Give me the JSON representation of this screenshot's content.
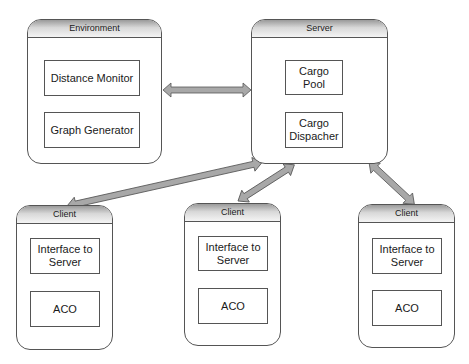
{
  "diagram": {
    "nodes": [
      {
        "id": "environment",
        "title": "Environment",
        "components": [
          "Distance Monitor",
          "Graph Generator"
        ]
      },
      {
        "id": "server",
        "title": "Server",
        "components": [
          "Cargo Pool",
          "Cargo Dispacher"
        ]
      },
      {
        "id": "client1",
        "title": "Client",
        "components": [
          "Interface to Server",
          "ACO"
        ]
      },
      {
        "id": "client2",
        "title": "Client",
        "components": [
          "Interface to Server",
          "ACO"
        ]
      },
      {
        "id": "client3",
        "title": "Client",
        "components": [
          "Interface to Server",
          "ACO"
        ]
      }
    ],
    "edges": [
      {
        "from": "environment",
        "to": "server",
        "type": "bidirectional"
      },
      {
        "from": "server",
        "to": "client1",
        "type": "bidirectional"
      },
      {
        "from": "server",
        "to": "client2",
        "type": "bidirectional"
      },
      {
        "from": "server",
        "to": "client3",
        "type": "bidirectional"
      }
    ],
    "colors": {
      "arrow_fill": "#a8a8a8",
      "arrow_stroke": "#555555",
      "header_gradient_top": "#9a9a9a",
      "header_gradient_bottom": "#f4f4f4"
    }
  },
  "labels": {
    "environment": {
      "title": "Environment",
      "c1": "Distance Monitor",
      "c2": "Graph Generator"
    },
    "server": {
      "title": "Server",
      "c1_line1": "Cargo",
      "c1_line2": "Pool",
      "c2_line1": "Cargo",
      "c2_line2": "Dispacher"
    },
    "client1": {
      "title": "Client",
      "c1_line1": "Interface to",
      "c1_line2": "Server",
      "c2": "ACO"
    },
    "client2": {
      "title": "Client",
      "c1_line1": "Interface to",
      "c1_line2": "Server",
      "c2": "ACO"
    },
    "client3": {
      "title": "Client",
      "c1_line1": "Interface to",
      "c1_line2": "Server",
      "c2": "ACO"
    }
  }
}
